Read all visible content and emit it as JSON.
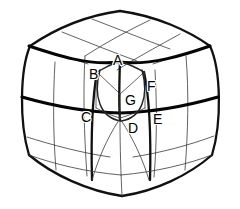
{
  "figure": {
    "kind": "line-diagram",
    "background_color": "#ffffff",
    "line_color": "#111111",
    "thin_line_color": "#3a3a3a",
    "label_color": "#000000"
  },
  "labels": [
    {
      "id": "A",
      "text": "A",
      "x": 113,
      "y": 53
    },
    {
      "id": "B",
      "text": "B",
      "x": 89,
      "y": 67
    },
    {
      "id": "C",
      "text": "C",
      "x": 81,
      "y": 110
    },
    {
      "id": "D",
      "text": "D",
      "x": 128,
      "y": 121
    },
    {
      "id": "E",
      "text": "E",
      "x": 153,
      "y": 112
    },
    {
      "id": "F",
      "text": "F",
      "x": 147,
      "y": 79
    },
    {
      "id": "G",
      "text": "G",
      "x": 125,
      "y": 93
    }
  ]
}
